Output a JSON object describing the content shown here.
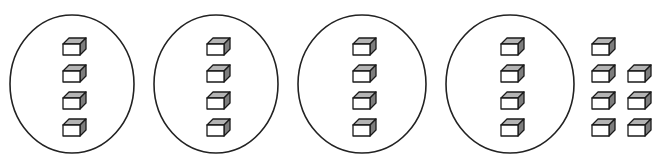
{
  "diagram": {
    "type": "grouped-counters",
    "canvas": {
      "width": 653,
      "height": 159,
      "background": "#ffffff"
    },
    "cube": {
      "icon_name": "unit-cube-icon",
      "width": 17,
      "height": 17,
      "depth": 6,
      "top_face_color": "#b4b4b4",
      "side_face_color": "#7d7d7d",
      "front_face_color": "#ffffff",
      "outline_color": "#1a1a1a"
    },
    "circle_style": {
      "stroke": "#222222",
      "fill": "#ffffff",
      "stroke_width": 1.6
    },
    "groups": [
      {
        "name": "group-1",
        "circled": true,
        "cube_count": 4,
        "circle": {
          "cx": 72,
          "cy": 84,
          "rx": 62,
          "ry": 69
        },
        "cube_positions": [
          {
            "x": 63,
            "y": 38
          },
          {
            "x": 63,
            "y": 65
          },
          {
            "x": 63,
            "y": 92
          },
          {
            "x": 63,
            "y": 119
          }
        ]
      },
      {
        "name": "group-2",
        "circled": true,
        "cube_count": 4,
        "circle": {
          "cx": 216,
          "cy": 84,
          "rx": 62,
          "ry": 69
        },
        "cube_positions": [
          {
            "x": 207,
            "y": 38
          },
          {
            "x": 207,
            "y": 65
          },
          {
            "x": 207,
            "y": 92
          },
          {
            "x": 207,
            "y": 119
          }
        ]
      },
      {
        "name": "group-3",
        "circled": true,
        "cube_count": 4,
        "circle": {
          "cx": 362,
          "cy": 84,
          "rx": 64,
          "ry": 69
        },
        "cube_positions": [
          {
            "x": 353,
            "y": 38
          },
          {
            "x": 353,
            "y": 65
          },
          {
            "x": 353,
            "y": 92
          },
          {
            "x": 353,
            "y": 119
          }
        ]
      },
      {
        "name": "group-4",
        "circled": true,
        "cube_count": 4,
        "circle": {
          "cx": 510,
          "cy": 84,
          "rx": 64,
          "ry": 69
        },
        "cube_positions": [
          {
            "x": 501,
            "y": 38
          },
          {
            "x": 501,
            "y": 65
          },
          {
            "x": 501,
            "y": 92
          },
          {
            "x": 501,
            "y": 119
          }
        ]
      },
      {
        "name": "leftover-group",
        "circled": false,
        "cube_count": 7,
        "cube_positions": [
          {
            "x": 592,
            "y": 38
          },
          {
            "x": 592,
            "y": 65
          },
          {
            "x": 628,
            "y": 65
          },
          {
            "x": 592,
            "y": 92
          },
          {
            "x": 628,
            "y": 92
          },
          {
            "x": 592,
            "y": 119
          },
          {
            "x": 628,
            "y": 119
          }
        ]
      }
    ],
    "totals": {
      "circled_group_count": 4,
      "cubes_per_circled_group": 4,
      "cubes_in_circled_groups": 16,
      "leftover_cube_count": 7,
      "total_cube_count": 23
    }
  }
}
